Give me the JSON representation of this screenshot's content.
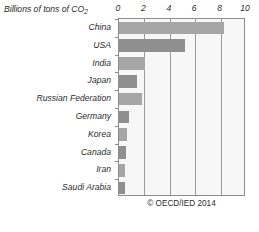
{
  "chart_data": {
    "type": "bar",
    "orientation": "horizontal",
    "title": "Billions of tons of CO2",
    "title_main": "Billions of tons of CO",
    "title_sub": "2",
    "xlabel": "",
    "ylabel": "",
    "xlim": [
      0,
      10
    ],
    "grid": true,
    "legend": false,
    "tick_labels": [
      "0",
      "2",
      "4",
      "6",
      "8",
      "10"
    ],
    "tick_values": [
      0,
      2,
      4,
      6,
      8,
      10
    ],
    "categories": [
      "China",
      "USA",
      "India",
      "Japan",
      "Russian Federation",
      "Germany",
      "Korea",
      "Canada",
      "Iran",
      "Saudi Arabia"
    ],
    "values": [
      8.3,
      5.2,
      2.05,
      1.4,
      1.8,
      0.8,
      0.6,
      0.55,
      0.5,
      0.45
    ],
    "bar_shades": [
      "light",
      "dark",
      "light",
      "dark",
      "light",
      "dark",
      "light",
      "dark",
      "light",
      "dark"
    ],
    "annotations": [
      "© OECD/IED 2014"
    ]
  },
  "credit": "© OECD/IED 2014",
  "colors": {
    "bar_light": "#a6a6a6",
    "bar_dark": "#8f8f8f",
    "plot_background": "#f7f7f7",
    "axis": "#8c8c8c",
    "text": "#2b2b2b"
  }
}
